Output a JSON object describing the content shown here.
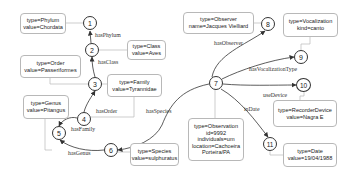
{
  "nodes": [
    {
      "id": "1",
      "label": "1"
    },
    {
      "id": "2",
      "label": "2"
    },
    {
      "id": "3",
      "label": "3"
    },
    {
      "id": "4",
      "label": "4"
    },
    {
      "id": "5",
      "label": "5"
    },
    {
      "id": "6",
      "label": "6"
    },
    {
      "id": "7",
      "label": "7"
    },
    {
      "id": "8",
      "label": "8"
    },
    {
      "id": "9",
      "label": "9"
    },
    {
      "id": "10",
      "label": "10"
    },
    {
      "id": "11",
      "label": "11"
    }
  ],
  "boxes": {
    "phylum": {
      "line1": "type=Phylum",
      "line2": "value=Chordata"
    },
    "class": {
      "line1": "type=Class",
      "line2": "value=Aves"
    },
    "order": {
      "line1": "type=Order",
      "line2": "value=Passeriformes"
    },
    "family": {
      "line1": "type=Family",
      "line2": "value=Tyrannidae"
    },
    "genus": {
      "line1": "type=Genus",
      "line2": "value=Pitangus"
    },
    "species": {
      "line1": "type=Species",
      "line2": "value=sulphuratus"
    },
    "observer": {
      "line1": "type=Observer",
      "line2": "name=Jacques Vielliard"
    },
    "vocalization": {
      "line1": "type=Vocalization",
      "line2": "kind=canto"
    },
    "device": {
      "line1": "type=RecorderDevice",
      "line2": "value=Nagra E"
    },
    "observation": {
      "line1": "type=Observation",
      "line2": "id=9992",
      "line3": "individuals=um",
      "line4": "location=Cachoeira",
      "line5": "Porteira/PA"
    },
    "date": {
      "line1": "type=Date",
      "line2": "value=19/04/1988"
    }
  },
  "edges": {
    "hasPhylum": "hasPhylum",
    "hasClass": "hasClass",
    "hasOrder": "hasOrder",
    "hasFamily": "hasFamily",
    "hasGenus": "hasGenus",
    "hasSpecies": "hasSpecies",
    "hasObserver": "hasObserver",
    "hasVocalizationType": "hasVocalizationType",
    "useDevice": "useDevice",
    "inDate": "inDate"
  },
  "colors": {
    "edge": "#333333",
    "connector": "#b8b8b8",
    "box_border": "#b8b8b8"
  }
}
